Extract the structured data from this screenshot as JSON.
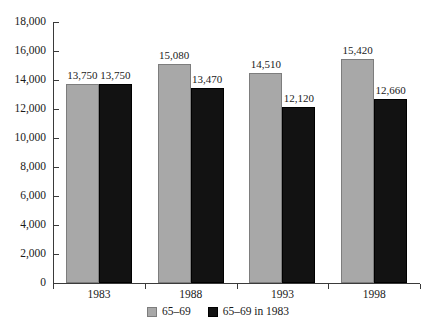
{
  "chart_data": {
    "type": "bar",
    "title": "",
    "subtitle": "",
    "xlabel": "",
    "ylabel": "",
    "categories": [
      "1983",
      "1988",
      "1993",
      "1998"
    ],
    "series": [
      {
        "name": "65–69",
        "color": "#a8a8a8",
        "values": [
          13750,
          15080,
          14510,
          15420
        ],
        "value_labels": [
          "13,750",
          "15,080",
          "14,510",
          "15,420"
        ]
      },
      {
        "name": "65–69 in 1983",
        "color": "#121212",
        "values": [
          13750,
          13470,
          12120,
          12660
        ],
        "value_labels": [
          "13,750",
          "13,470",
          "12,120",
          "12,660"
        ]
      }
    ],
    "ylim": [
      0,
      18000
    ],
    "ytick_step": 2000,
    "ytick_values": [
      0,
      2000,
      4000,
      6000,
      8000,
      10000,
      12000,
      14000,
      16000,
      18000
    ],
    "ytick_labels": [
      "0",
      "2,000",
      "4,000",
      "6,000",
      "8,000",
      "10,000",
      "12,000",
      "14,000",
      "16,000",
      "18,000"
    ],
    "grid": false,
    "legend_position": "bottom-center",
    "data_labels_shown": true
  },
  "legend": {
    "items": [
      {
        "label": "65–69",
        "color": "#a8a8a8"
      },
      {
        "label": "65–69 in 1983",
        "color": "#121212"
      }
    ]
  },
  "colors": {
    "series_gray": "#a8a8a8",
    "series_black": "#121212",
    "axis": "#3a3a3a",
    "text": "#1a1a1a",
    "background": "#ffffff"
  }
}
